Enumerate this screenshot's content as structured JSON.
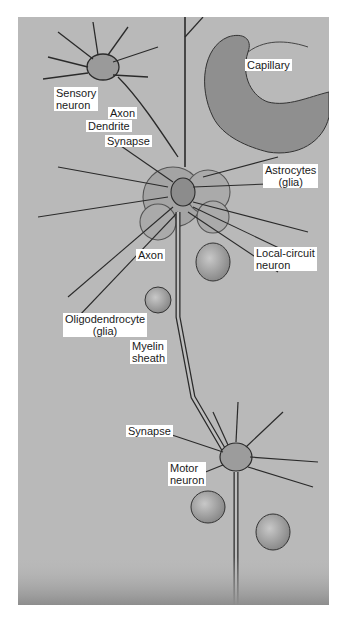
{
  "figure": {
    "labels": {
      "capillary": "Capillary",
      "sensory_neuron": [
        "Sensory",
        "neuron"
      ],
      "axon_top": "Axon",
      "dendrite": "Dendrite",
      "synapse_top": "Synapse",
      "astrocytes": [
        "Astrocytes",
        "(glia)"
      ],
      "axon_mid": "Axon",
      "local_circuit_neuron": [
        "Local-circuit",
        "neuron"
      ],
      "oligodendrocyte": [
        "Oligodendrocyte",
        "(glia)"
      ],
      "myelin_sheath": [
        "Myelin",
        "sheath"
      ],
      "synapse_bottom": "Synapse",
      "motor_neuron": [
        "Motor",
        "neuron"
      ]
    },
    "colors": {
      "background": "#b9b9b9",
      "ink": "#2a2a2a",
      "label_bg": "#ffffff"
    }
  }
}
